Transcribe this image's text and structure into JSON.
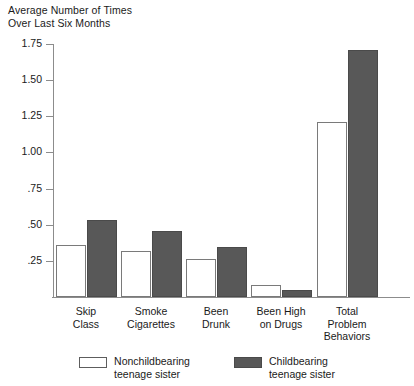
{
  "chart_data": {
    "type": "bar",
    "title": "Average Number of Times\nOver Last Six Months",
    "xlabel": "",
    "ylabel": "",
    "ylim": [
      0,
      1.75
    ],
    "grid": false,
    "legend_position": "bottom",
    "ytick_labels": [
      "1.75",
      "1.50",
      "1.25",
      "1.00",
      ".75",
      ".50",
      ".25"
    ],
    "ytick_values": [
      1.75,
      1.5,
      1.25,
      1.0,
      0.75,
      0.5,
      0.25
    ],
    "categories": [
      "Skip\nClass",
      "Smoke\nCigarettes",
      "Been\nDrunk",
      "Been High\non Drugs",
      "Total\nProblem\nBehaviors"
    ],
    "series": [
      {
        "name": "Nonchildbearing\nteenage sister",
        "color": "#ffffff",
        "values": [
          0.36,
          0.32,
          0.26,
          0.08,
          1.21
        ]
      },
      {
        "name": "Childbearing\nteenage sister",
        "color": "#585858",
        "values": [
          0.53,
          0.46,
          0.345,
          0.05,
          1.71
        ]
      }
    ]
  },
  "legend": {
    "entries": [
      {
        "label": "Nonchildbearing\nteenage sister",
        "swatch": "open"
      },
      {
        "label": "Childbearing\nteenage sister",
        "swatch": "filled"
      }
    ]
  }
}
